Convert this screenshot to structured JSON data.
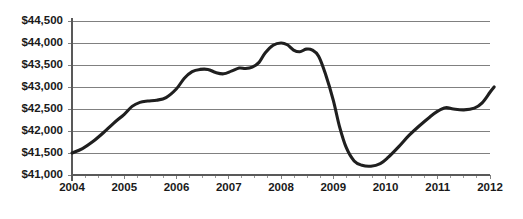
{
  "chart_data": {
    "type": "line",
    "title": "",
    "subtitle": "",
    "xlabel": "",
    "ylabel": "",
    "xlim": [
      2004,
      2012
    ],
    "ylim": [
      41000,
      44500
    ],
    "grid": true,
    "legend_position": "none",
    "x_tick_labels": [
      "2004",
      "2005",
      "2006",
      "2007",
      "2008",
      "2009",
      "2010",
      "2011",
      "2012"
    ],
    "x_tick_values": [
      2004,
      2005,
      2006,
      2007,
      2008,
      2009,
      2010,
      2011,
      2012
    ],
    "x_minor_ticks_per_interval": 4,
    "y_tick_labels": [
      "$41,000",
      "$41,500",
      "$42,000",
      "$42,500",
      "$43,000",
      "$43,500",
      "$44,000",
      "$44,500"
    ],
    "y_tick_values": [
      41000,
      41500,
      42000,
      42500,
      43000,
      43500,
      44000,
      44500
    ],
    "value_prefix": "$",
    "series": [
      {
        "name": "Series 1",
        "color": "#1f1f1f",
        "x": [
          2004.0,
          2004.25,
          2004.5,
          2004.75,
          2005.0,
          2005.25,
          2005.5,
          2005.75,
          2006.0,
          2006.25,
          2006.5,
          2006.75,
          2007.0,
          2007.25,
          2007.5,
          2007.75,
          2008.0,
          2008.25,
          2008.5,
          2008.75,
          2009.0,
          2009.25,
          2009.5,
          2009.75,
          2010.0,
          2010.25,
          2010.5,
          2010.75,
          2011.0,
          2011.25,
          2011.5,
          2011.75,
          2012.0
        ],
        "values": [
          41500,
          41620,
          41800,
          42050,
          42300,
          42560,
          42660,
          42700,
          42760,
          42980,
          43290,
          43400,
          43420,
          43330,
          43330,
          43430,
          43480,
          43470,
          43620,
          43850,
          43960,
          44000,
          43930,
          43760,
          43830,
          43800,
          43600,
          43000,
          42200,
          41560,
          41260,
          41200,
          41230
        ]
      }
    ],
    "series_full": {
      "name": "Series 1",
      "x": [
        2004.0,
        2004.2,
        2004.4,
        2004.6,
        2004.8,
        2005.0,
        2005.2,
        2005.4,
        2005.6,
        2005.8,
        2006.0,
        2006.2,
        2006.4,
        2006.6,
        2006.8,
        2007.0,
        2007.2,
        2007.4,
        2007.6,
        2007.8,
        2008.0,
        2008.2,
        2008.4,
        2008.6,
        2008.8,
        2009.0,
        2009.2,
        2009.4,
        2009.6,
        2009.8,
        2010.0,
        2010.2,
        2010.4,
        2010.6,
        2010.8,
        2011.0,
        2011.2,
        2011.4,
        2011.6,
        2011.8,
        2012.0
      ],
      "values": [
        41500,
        41600,
        41760,
        41960,
        42180,
        42380,
        42580,
        42670,
        42700,
        42740,
        42800,
        43020,
        43300,
        43400,
        43410,
        43340,
        43330,
        43420,
        43470,
        43480,
        43540,
        43720,
        43900,
        43990,
        43990,
        43880,
        43780,
        43830,
        43800,
        43520,
        42800,
        42000,
        41500,
        41240,
        41190,
        41230,
        41400,
        41700,
        42000,
        42300,
        42500
      ]
    },
    "annotations": {
      "start_value": 41500,
      "peak_value": 44000,
      "peak_year": 2007.6,
      "trough_value": 41200,
      "trough_year": 2009.5,
      "end_value": 43000,
      "end_year": 2012
    },
    "curve_points": [
      [
        2004.0,
        41500
      ],
      [
        2004.2,
        41600
      ],
      [
        2004.4,
        41760
      ],
      [
        2004.6,
        41960
      ],
      [
        2004.8,
        42180
      ],
      [
        2005.0,
        42380
      ],
      [
        2005.15,
        42560
      ],
      [
        2005.3,
        42650
      ],
      [
        2005.45,
        42680
      ],
      [
        2005.62,
        42700
      ],
      [
        2005.8,
        42760
      ],
      [
        2006.0,
        42960
      ],
      [
        2006.15,
        43200
      ],
      [
        2006.3,
        43350
      ],
      [
        2006.45,
        43400
      ],
      [
        2006.6,
        43400
      ],
      [
        2006.75,
        43330
      ],
      [
        2006.9,
        43300
      ],
      [
        2007.05,
        43360
      ],
      [
        2007.2,
        43430
      ],
      [
        2007.32,
        43420
      ],
      [
        2007.45,
        43450
      ],
      [
        2007.58,
        43560
      ],
      [
        2007.7,
        43780
      ],
      [
        2007.85,
        43950
      ],
      [
        2008.0,
        44000
      ],
      [
        2008.12,
        43960
      ],
      [
        2008.24,
        43840
      ],
      [
        2008.36,
        43800
      ],
      [
        2008.48,
        43860
      ],
      [
        2008.6,
        43840
      ],
      [
        2008.72,
        43700
      ],
      [
        2008.85,
        43300
      ],
      [
        2009.0,
        42700
      ],
      [
        2009.12,
        42100
      ],
      [
        2009.25,
        41620
      ],
      [
        2009.4,
        41320
      ],
      [
        2009.55,
        41220
      ],
      [
        2009.72,
        41200
      ],
      [
        2009.9,
        41260
      ],
      [
        2010.05,
        41400
      ],
      [
        2010.25,
        41640
      ],
      [
        2010.45,
        41900
      ],
      [
        2010.65,
        42120
      ],
      [
        2010.85,
        42320
      ],
      [
        2011.0,
        42450
      ],
      [
        2011.15,
        42530
      ],
      [
        2011.3,
        42500
      ],
      [
        2011.5,
        42480
      ],
      [
        2011.7,
        42520
      ],
      [
        2011.85,
        42640
      ],
      [
        2012.0,
        42880
      ],
      [
        2012.08,
        43000
      ]
    ]
  }
}
